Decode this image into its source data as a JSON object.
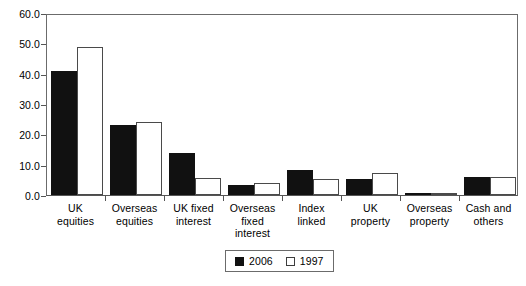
{
  "chart_data": {
    "type": "bar",
    "title": "",
    "subtitle": "",
    "xlabel": "",
    "ylabel": "",
    "ylim": [
      0,
      60
    ],
    "ytick_step": 10,
    "grid": false,
    "legend_position": "bottom-center",
    "categories": [
      "UK\nequities",
      "Overseas\nequities",
      "UK fixed\ninterest",
      "Overseas\nfixed\ninterest",
      "Index\nlinked",
      "UK\nproperty",
      "Overseas\nproperty",
      "Cash and\nothers"
    ],
    "ytick_labels": [
      "60.0",
      "50.0",
      "40.0",
      "30.0",
      "20.0",
      "10.0",
      "0.0"
    ],
    "ytick_values": [
      60.0,
      50.0,
      40.0,
      30.0,
      20.0,
      10.0,
      0.0
    ],
    "series": [
      {
        "name": "2006",
        "color": "#111111",
        "style": "filled",
        "values": [
          41.0,
          23.0,
          14.0,
          3.2,
          8.2,
          5.2,
          0.2,
          5.9
        ]
      },
      {
        "name": "1997",
        "color": "#ffffff",
        "style": "hollow",
        "values": [
          48.8,
          24.2,
          5.5,
          3.8,
          5.2,
          7.2,
          0.8,
          5.8
        ]
      }
    ]
  },
  "legend": {
    "entries": [
      {
        "label": "2006",
        "swatch": "filled-square"
      },
      {
        "label": "1997",
        "swatch": "hollow-square"
      }
    ]
  },
  "colors": {
    "series_2006": "#111111",
    "series_1997": "#ffffff",
    "axis": "#555555",
    "frame": "#6b6b6b",
    "background": "#ffffff"
  }
}
